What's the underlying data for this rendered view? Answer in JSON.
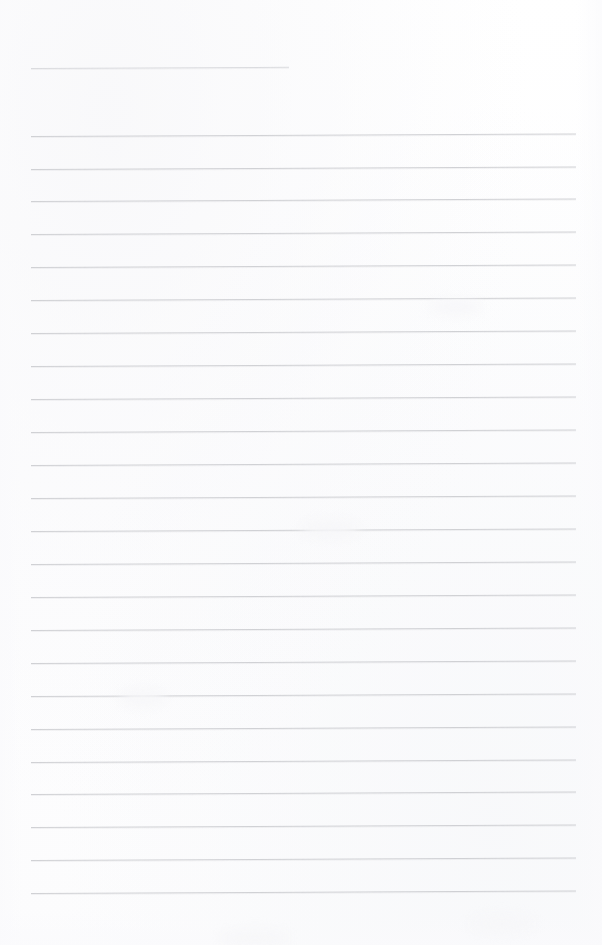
{
  "page": {
    "type": "blank-ruled-paper",
    "width": 602,
    "height": 945,
    "background_color": "#fefefe",
    "rule_color": "#c9cace",
    "short_rule_color": "#d3d4d8",
    "content_text": ""
  },
  "rules": {
    "count": 25,
    "left_margin_x": 31,
    "right_end_x": 576,
    "short_rule_right_end_x": 289,
    "line_spacing": 32.9,
    "slope_rise_px": -2.5,
    "lines": [
      {
        "index": 1,
        "y": 68,
        "x1": 31,
        "x2": 289,
        "short": true
      },
      {
        "index": 2,
        "y": 136,
        "x1": 31,
        "x2": 576,
        "short": false
      },
      {
        "index": 3,
        "y": 169,
        "x1": 31,
        "x2": 576,
        "short": false
      },
      {
        "index": 4,
        "y": 201,
        "x1": 31,
        "x2": 576,
        "short": false
      },
      {
        "index": 5,
        "y": 234,
        "x1": 31,
        "x2": 576,
        "short": false
      },
      {
        "index": 6,
        "y": 267,
        "x1": 31,
        "x2": 576,
        "short": false
      },
      {
        "index": 7,
        "y": 300,
        "x1": 31,
        "x2": 576,
        "short": false
      },
      {
        "index": 8,
        "y": 333,
        "x1": 31,
        "x2": 576,
        "short": false
      },
      {
        "index": 9,
        "y": 366,
        "x1": 31,
        "x2": 576,
        "short": false
      },
      {
        "index": 10,
        "y": 399,
        "x1": 31,
        "x2": 576,
        "short": false
      },
      {
        "index": 11,
        "y": 432,
        "x1": 31,
        "x2": 576,
        "short": false
      },
      {
        "index": 12,
        "y": 465,
        "x1": 31,
        "x2": 576,
        "short": false
      },
      {
        "index": 13,
        "y": 498,
        "x1": 31,
        "x2": 576,
        "short": false
      },
      {
        "index": 14,
        "y": 531,
        "x1": 31,
        "x2": 576,
        "short": false
      },
      {
        "index": 15,
        "y": 564,
        "x1": 31,
        "x2": 576,
        "short": false
      },
      {
        "index": 16,
        "y": 597,
        "x1": 31,
        "x2": 576,
        "short": false
      },
      {
        "index": 17,
        "y": 630,
        "x1": 31,
        "x2": 576,
        "short": false
      },
      {
        "index": 18,
        "y": 663,
        "x1": 31,
        "x2": 576,
        "short": false
      },
      {
        "index": 19,
        "y": 696,
        "x1": 31,
        "x2": 576,
        "short": false
      },
      {
        "index": 20,
        "y": 729,
        "x1": 31,
        "x2": 576,
        "short": false
      },
      {
        "index": 21,
        "y": 762,
        "x1": 31,
        "x2": 576,
        "short": false
      },
      {
        "index": 22,
        "y": 794,
        "x1": 31,
        "x2": 576,
        "short": false
      },
      {
        "index": 23,
        "y": 827,
        "x1": 31,
        "x2": 576,
        "short": false
      },
      {
        "index": 24,
        "y": 860,
        "x1": 31,
        "x2": 576,
        "short": false
      },
      {
        "index": 25,
        "y": 893,
        "x1": 31,
        "x2": 576,
        "short": false
      }
    ]
  },
  "smudges": [
    {
      "x": 120,
      "y": 690,
      "w": 46,
      "h": 16
    },
    {
      "x": 300,
      "y": 520,
      "w": 60,
      "h": 18
    },
    {
      "x": 430,
      "y": 300,
      "w": 52,
      "h": 14
    },
    {
      "x": 220,
      "y": 930,
      "w": 70,
      "h": 16
    },
    {
      "x": 470,
      "y": 915,
      "w": 64,
      "h": 18
    }
  ]
}
